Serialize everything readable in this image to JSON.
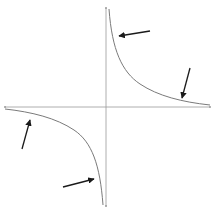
{
  "diagram": {
    "type": "hyperbola",
    "colors": {
      "background": "#ffffff",
      "axis": "#9a9a9a",
      "curve": "#7a7a7a",
      "arrow": "#1a1a1a"
    },
    "axes": {
      "x_axis": {
        "x1": 5,
        "y1": 107,
        "x2": 210,
        "y2": 107
      },
      "y_axis": {
        "x1": 106,
        "y1": 8,
        "x2": 106,
        "y2": 206
      }
    },
    "branches": [
      {
        "name": "quadrant-1",
        "quadrant": "I"
      },
      {
        "name": "quadrant-3",
        "quadrant": "III"
      }
    ],
    "arrows": [
      {
        "name": "arrow-near-y-axis-top",
        "from": [
          150,
          31
        ],
        "to": [
          119,
          36
        ]
      },
      {
        "name": "arrow-near-x-axis-right",
        "from": [
          190,
          68
        ],
        "to": [
          182,
          98
        ]
      },
      {
        "name": "arrow-near-x-axis-left",
        "from": [
          22,
          149
        ],
        "to": [
          30,
          120
        ]
      },
      {
        "name": "arrow-near-y-axis-bottom",
        "from": [
          63,
          187
        ],
        "to": [
          94,
          179
        ]
      }
    ]
  }
}
